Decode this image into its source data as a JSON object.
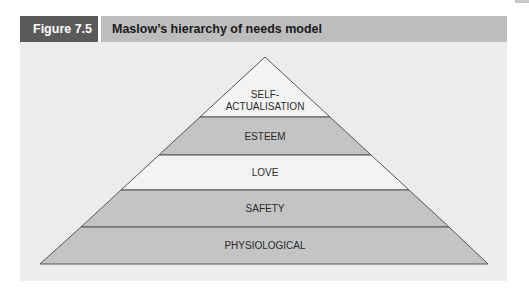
{
  "figure": {
    "number": "Figure 7.5",
    "title": "Maslow’s hierarchy of needs model"
  },
  "diagram": {
    "type": "pyramid",
    "colors": {
      "panel_bg": "#ececec",
      "tier_light": "#f3f3f3",
      "tier_dark": "#c4c4c4",
      "outline": "#555555",
      "header_dark": "#5a5a5a",
      "header_light": "#bdbdbd"
    },
    "tiers": [
      {
        "label_line1": "SELF-",
        "label_line2": "ACTUALISATION",
        "shade": "light"
      },
      {
        "label": "ESTEEM",
        "shade": "dark"
      },
      {
        "label": "LOVE",
        "shade": "light"
      },
      {
        "label": "SAFETY",
        "shade": "dark"
      },
      {
        "label": "PHYSIOLOGICAL",
        "shade": "dark"
      }
    ]
  }
}
